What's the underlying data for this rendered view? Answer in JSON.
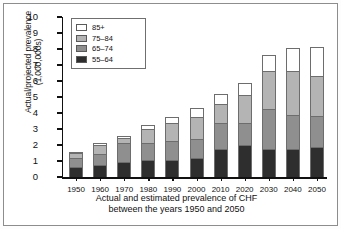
{
  "chart_data": {
    "type": "bar",
    "stacked": true,
    "title": "",
    "xlabel": "Actual and estimated prevalence of CHF between the years 1950 and 2050",
    "ylabel": "Actual/projected prevalence (1,000,000s)",
    "ylim": [
      0,
      10
    ],
    "ytick_labels": [
      "0",
      "1",
      "2",
      "3",
      "4",
      "5",
      "6",
      "7",
      "8",
      "9",
      "10"
    ],
    "ytick_values": [
      0,
      1,
      2,
      3,
      4,
      5,
      6,
      7,
      8,
      9,
      10
    ],
    "grid": false,
    "legend_position": "top-left",
    "categories": [
      "1950",
      "1960",
      "1970",
      "1980",
      "1990",
      "2000",
      "2010",
      "2020",
      "2030",
      "2040",
      "2050"
    ],
    "series": [
      {
        "name": "55–64",
        "color": "#2e2e2e",
        "values": [
          0.65,
          0.78,
          0.95,
          1.05,
          1.07,
          1.2,
          1.77,
          2.0,
          1.73,
          1.78,
          1.85
        ]
      },
      {
        "name": "65–74",
        "color": "#8f8f8f",
        "values": [
          0.55,
          0.67,
          1.15,
          1.07,
          1.18,
          1.2,
          1.58,
          1.4,
          2.55,
          2.08,
          1.97
        ]
      },
      {
        "name": "75–84",
        "color": "#b4b4b4",
        "values": [
          0.3,
          0.55,
          0.32,
          0.9,
          1.15,
          1.35,
          1.2,
          1.75,
          2.35,
          2.75,
          2.5
        ]
      },
      {
        "name": "85+",
        "color": "#ffffff",
        "values": [
          0.07,
          0.13,
          0.12,
          0.23,
          0.37,
          0.55,
          0.67,
          0.73,
          1.02,
          1.47,
          1.82
        ]
      }
    ],
    "totals": [
      1.57,
      2.13,
      2.54,
      3.25,
      3.77,
      4.3,
      5.22,
      5.88,
      7.65,
      8.08,
      8.14
    ]
  },
  "caption": {
    "line1": "Actual and estimated prevalence of CHF",
    "line2": "between the years 1950 and 2050"
  },
  "axis": {
    "ylabel_line1": "Actual/projected prevalence",
    "ylabel_line2": "(1,000,000s)"
  }
}
